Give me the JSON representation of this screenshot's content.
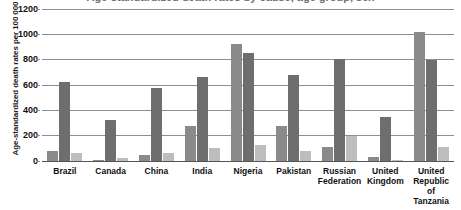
{
  "chart": {
    "title": "Age-standardized death rates by cause, age group, sex",
    "y_axis_title": "Age-standardized death rates per 100 000"
  },
  "chart_data": {
    "type": "bar",
    "title": "Age-standardized death rates by cause, age group, sex",
    "xlabel": "",
    "ylabel": "Age-standardized death rates per 100 000",
    "ylim": [
      0,
      1200
    ],
    "yticks": [
      0,
      200,
      400,
      600,
      800,
      1000,
      1200
    ],
    "grid": true,
    "legend": "none",
    "categories": [
      "Brazil",
      "Canada",
      "China",
      "India",
      "Nigeria",
      "Pakistan",
      "Russian Federation",
      "United Kingdom",
      "United Republic of Tanzania"
    ],
    "category_lines": [
      [
        "Brazil"
      ],
      [
        "Canada"
      ],
      [
        "China"
      ],
      [
        "India"
      ],
      [
        "Nigeria"
      ],
      [
        "Pakistan"
      ],
      [
        "Russian",
        "Federation"
      ],
      [
        "United",
        "Kingdom"
      ],
      [
        "United",
        "Republic",
        "of Tanzania"
      ]
    ],
    "series": [
      {
        "name": "Series 1",
        "color": "#8a8a8a",
        "values": [
          80,
          5,
          50,
          280,
          925,
          280,
          110,
          35,
          1020
        ]
      },
      {
        "name": "Series 2",
        "color": "#6e6e6e",
        "values": [
          625,
          325,
          575,
          665,
          850,
          680,
          805,
          350,
          800
        ]
      },
      {
        "name": "Series 3",
        "color": "#bdbdbd",
        "values": [
          65,
          20,
          65,
          100,
          130,
          80,
          195,
          5,
          110
        ]
      }
    ]
  }
}
